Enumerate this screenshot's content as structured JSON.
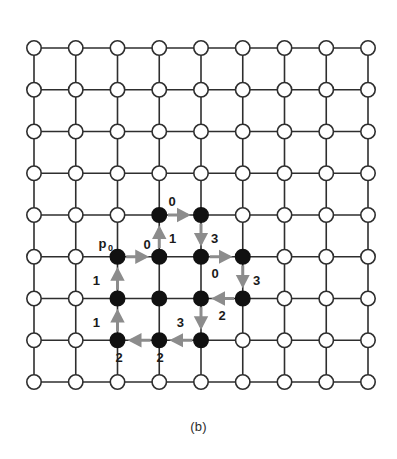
{
  "figure": {
    "caption": "(b)",
    "background_color": "#ffffff"
  },
  "grid": {
    "rows": 9,
    "cols": 9,
    "origin_x": 34,
    "origin_y": 48,
    "spacing": 41.75,
    "node_radius": 7.2,
    "line_color": "#2e2e2e",
    "line_width": 1.6,
    "open_node_fill": "#ffffff",
    "open_node_stroke": "#2e2e2e",
    "filled_node_fill": "#111111",
    "filled_node_stroke": "#111111"
  },
  "filled_nodes": [
    {
      "col": 3,
      "row": 4
    },
    {
      "col": 4,
      "row": 4
    },
    {
      "col": 2,
      "row": 5
    },
    {
      "col": 3,
      "row": 5
    },
    {
      "col": 4,
      "row": 5
    },
    {
      "col": 5,
      "row": 5
    },
    {
      "col": 2,
      "row": 6
    },
    {
      "col": 3,
      "row": 6
    },
    {
      "col": 4,
      "row": 6
    },
    {
      "col": 5,
      "row": 6
    },
    {
      "col": 2,
      "row": 7
    },
    {
      "col": 3,
      "row": 7
    },
    {
      "col": 4,
      "row": 7
    }
  ],
  "start_point": {
    "label": "p",
    "subscript": "0",
    "col": 2,
    "row": 5
  },
  "chain_code": {
    "directions": {
      "0": "right",
      "1": "up",
      "2": "left",
      "3": "down"
    },
    "sequence": [
      "0",
      "1",
      "0",
      "3",
      "0",
      "3",
      "2",
      "3",
      "2",
      "2",
      "1",
      "1"
    ],
    "arrow_color": "#8c8c8c",
    "arrow_width": 3.0,
    "steps": [
      {
        "code": "0",
        "from_col": 2,
        "from_row": 5,
        "to_col": 3,
        "to_row": 5,
        "label_x": 147,
        "label_y": 249,
        "label_anchor": "middle"
      },
      {
        "code": "1",
        "from_col": 3,
        "from_row": 5,
        "to_col": 3,
        "to_row": 4,
        "label_x": 169,
        "label_y": 243,
        "label_anchor": "start"
      },
      {
        "code": "0",
        "from_col": 3,
        "from_row": 4,
        "to_col": 4,
        "to_row": 4,
        "label_x": 172,
        "label_y": 206,
        "label_anchor": "middle"
      },
      {
        "code": "3",
        "from_col": 4,
        "from_row": 4,
        "to_col": 4,
        "to_row": 5,
        "label_x": 211,
        "label_y": 243,
        "label_anchor": "start"
      },
      {
        "code": "0",
        "from_col": 4,
        "from_row": 5,
        "to_col": 5,
        "to_row": 5,
        "label_x": 215,
        "label_y": 278,
        "label_anchor": "middle"
      },
      {
        "code": "3",
        "from_col": 5,
        "from_row": 5,
        "to_col": 5,
        "to_row": 6,
        "label_x": 253,
        "label_y": 285,
        "label_anchor": "start"
      },
      {
        "code": "2",
        "from_col": 5,
        "from_row": 6,
        "to_col": 4,
        "to_row": 6,
        "label_x": 222,
        "label_y": 320,
        "label_anchor": "middle"
      },
      {
        "code": "3",
        "from_col": 4,
        "from_row": 6,
        "to_col": 4,
        "to_row": 7,
        "label_x": 184,
        "label_y": 327,
        "label_anchor": "end"
      },
      {
        "code": "2",
        "from_col": 4,
        "from_row": 7,
        "to_col": 3,
        "to_row": 7,
        "label_x": 160,
        "label_y": 362,
        "label_anchor": "middle"
      },
      {
        "code": "2",
        "from_col": 3,
        "from_row": 7,
        "to_col": 2,
        "to_row": 7,
        "label_x": 119,
        "label_y": 362,
        "label_anchor": "middle"
      },
      {
        "code": "1",
        "from_col": 2,
        "from_row": 7,
        "to_col": 2,
        "to_row": 6,
        "label_x": 100,
        "label_y": 327,
        "label_anchor": "end"
      },
      {
        "code": "1",
        "from_col": 2,
        "from_row": 6,
        "to_col": 2,
        "to_row": 5,
        "label_x": 100,
        "label_y": 285,
        "label_anchor": "end"
      }
    ]
  }
}
